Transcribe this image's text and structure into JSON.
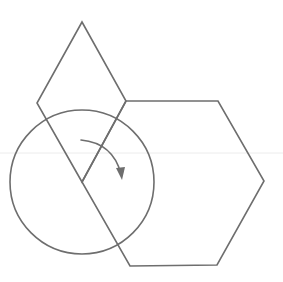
{
  "figure": {
    "background": "#ffffff",
    "stroke_color": "#6e6e6e",
    "stroke_width": 1.6,
    "shapes": {
      "rhombus": {
        "points": "82,22 126,101 82,182 37,103"
      },
      "hexagon": {
        "points": "126,101 218,101 264,181 217,265 130,266 82,182"
      },
      "circle": {
        "cx": 82,
        "cy": 182,
        "r": 72
      },
      "rotation_arrow": {
        "path": "M 81 140 Q 113 143 121 174",
        "direction": "clockwise",
        "head_points": "116,168 122,180 125,167"
      }
    },
    "scan_artifact": {
      "y": 153,
      "color": "#ececec"
    }
  }
}
